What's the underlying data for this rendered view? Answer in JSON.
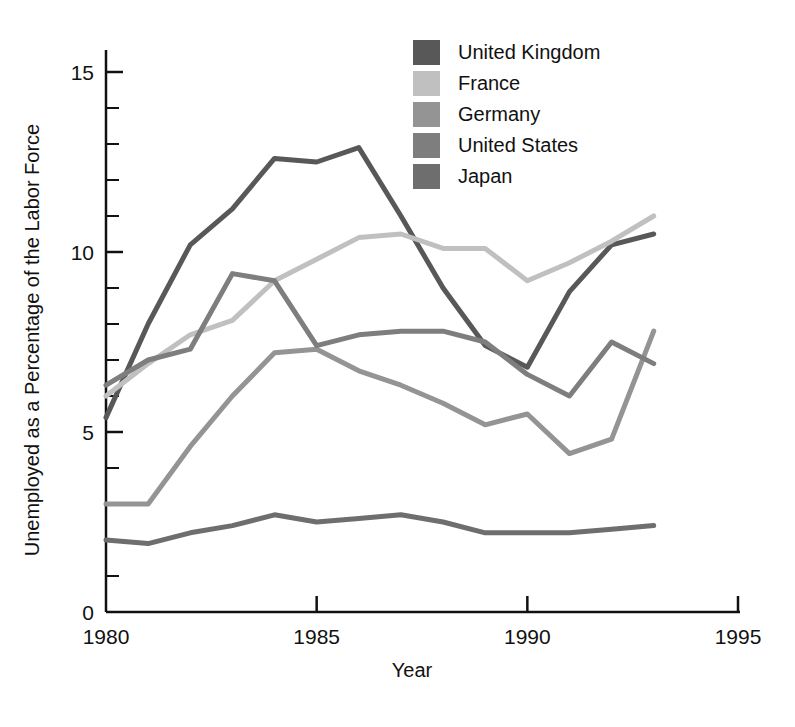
{
  "chart_data": {
    "type": "line",
    "title": "",
    "xlabel": "Year",
    "ylabel": "Unemployed as a Percentage of the Labor Force",
    "xlim": [
      1980,
      1995
    ],
    "ylim": [
      0,
      15.8
    ],
    "grid": false,
    "legend_position": "top-right",
    "x_ticks": [
      "1980",
      "1985",
      "1990",
      "1995"
    ],
    "x_tick_values": [
      1980,
      1985,
      1990,
      1995
    ],
    "y_ticks": [
      "0",
      "5",
      "10",
      "15"
    ],
    "y_tick_values": [
      0,
      5,
      10,
      15
    ],
    "y_minor_step": 1,
    "x": [
      1980,
      1981,
      1982,
      1983,
      1984,
      1985,
      1986,
      1987,
      1988,
      1989,
      1990,
      1991,
      1992,
      1993
    ],
    "series": [
      {
        "name": "United Kingdom",
        "color": "#585858",
        "values": [
          5.4,
          8.0,
          10.2,
          11.2,
          12.6,
          12.5,
          12.9,
          11.0,
          9.0,
          7.4,
          6.8,
          8.9,
          10.2,
          10.5
        ]
      },
      {
        "name": "France",
        "color": "#c0c0c0",
        "values": [
          6.0,
          6.9,
          7.7,
          8.1,
          9.2,
          9.8,
          10.4,
          10.5,
          10.1,
          10.1,
          9.2,
          9.7,
          10.3,
          11.0
        ]
      },
      {
        "name": "Germany",
        "color": "#949494",
        "values": [
          3.0,
          3.0,
          4.6,
          6.0,
          7.2,
          7.3,
          6.7,
          6.3,
          5.8,
          5.2,
          5.5,
          4.4,
          4.8,
          7.8
        ]
      },
      {
        "name": "United States",
        "color": "#7e7e7e",
        "values": [
          6.3,
          7.0,
          7.3,
          9.4,
          9.2,
          7.4,
          7.7,
          7.8,
          7.8,
          7.5,
          6.6,
          6.0,
          7.5,
          6.9
        ]
      },
      {
        "name": "Japan",
        "color": "#6e6e6e",
        "values": [
          2.0,
          1.9,
          2.2,
          2.4,
          2.7,
          2.5,
          2.6,
          2.7,
          2.5,
          2.2,
          2.2,
          2.2,
          2.3,
          2.4
        ]
      }
    ]
  },
  "legend": {
    "items": [
      {
        "label": "United Kingdom",
        "swatch": "#585858"
      },
      {
        "label": "France",
        "swatch": "#c0c0c0"
      },
      {
        "label": "Germany",
        "swatch": "#949494"
      },
      {
        "label": "United States",
        "swatch": "#7e7e7e"
      },
      {
        "label": "Japan",
        "swatch": "#6e6e6e"
      }
    ]
  },
  "axes": {
    "x_title": "Year",
    "y_title": "Unemployed as a Percentage of the Labor Force",
    "x_tick_labels": [
      "1980",
      "1985",
      "1990",
      "1995"
    ],
    "y_tick_labels": [
      "0",
      "5",
      "10",
      "15"
    ]
  }
}
